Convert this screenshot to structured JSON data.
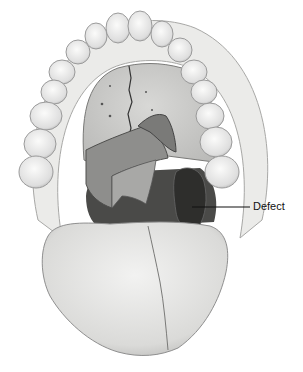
{
  "figure": {
    "annotations": [
      {
        "label": "Defect",
        "line_from": [
          192,
          207
        ],
        "line_to": [
          250,
          207
        ],
        "text_x": 253,
        "text_y": 201
      }
    ]
  },
  "colors": {
    "background": "#ffffff",
    "line": "#111111",
    "tooth": "#f4f4f2",
    "tooth_stroke": "#9a9a9a",
    "gum": "#e8e8e6",
    "palate": "#cfcfcd",
    "soft_palate": "#9d9d9b",
    "defect": "#3a3a3a",
    "throat": "#555555",
    "tongue": "#e2e2e0",
    "tongue_stroke": "#8f8f8f"
  }
}
